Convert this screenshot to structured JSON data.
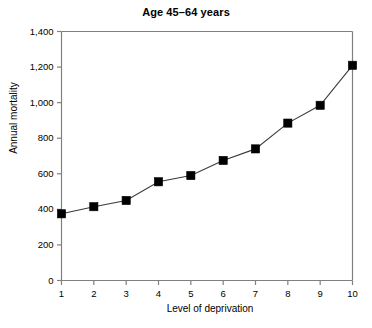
{
  "chart_data": {
    "type": "line",
    "title": "Age 45–64 years",
    "xlabel": "Level of deprivation",
    "ylabel": "Annual mortality",
    "x": [
      1,
      2,
      3,
      4,
      5,
      6,
      7,
      8,
      9,
      10
    ],
    "categories": [
      "1",
      "2",
      "3",
      "4",
      "5",
      "6",
      "7",
      "8",
      "9",
      "10"
    ],
    "values": [
      375,
      415,
      450,
      555,
      590,
      675,
      740,
      885,
      985,
      1210
    ],
    "series": [
      {
        "name": "Annual mortality",
        "values": [
          375,
          415,
          450,
          555,
          590,
          675,
          740,
          885,
          985,
          1210
        ]
      }
    ],
    "xlim": [
      1,
      10
    ],
    "ylim": [
      0,
      1400
    ],
    "ytick_values": [
      0,
      200,
      400,
      600,
      800,
      1000,
      1200,
      1400
    ],
    "ytick_labels": [
      "0",
      "200",
      "400",
      "600",
      "800",
      "1,000",
      "1,200",
      "1,400"
    ],
    "xtick_values": [
      1,
      2,
      3,
      4,
      5,
      6,
      7,
      8,
      9,
      10
    ],
    "xtick_labels": [
      "1",
      "2",
      "3",
      "4",
      "5",
      "6",
      "7",
      "8",
      "9",
      "10"
    ],
    "grid": false,
    "legend": null,
    "marker": "square",
    "marker_color": "#000000",
    "line_color": "#3a3a3a",
    "background_color": "#ffffff",
    "axis_color": "#808080"
  }
}
